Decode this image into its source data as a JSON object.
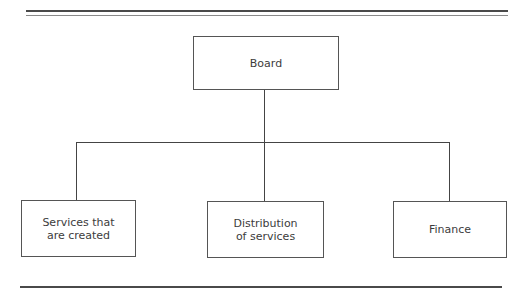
{
  "diagram": {
    "type": "org-chart",
    "root": {
      "label": "Board"
    },
    "children": [
      {
        "label": "Services that\nare created"
      },
      {
        "label": "Distribution\nof services"
      },
      {
        "label": "Finance"
      }
    ],
    "colors": {
      "line": "#444444",
      "text": "#3c3c3c",
      "background": "#ffffff"
    }
  }
}
